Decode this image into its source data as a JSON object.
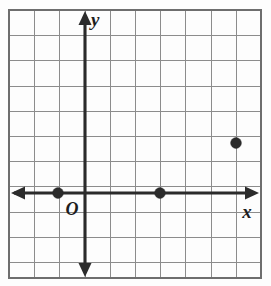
{
  "figure": {
    "kind": "coordinate-plane",
    "axis_labels": {
      "x": "x",
      "y": "y",
      "origin": "O"
    },
    "colors": {
      "background": "#fdfdfd",
      "grid_line": "#8c8c8c",
      "grid_border": "#6e6e6e",
      "axis": "#2b2b2b",
      "point": "#2b2b2b",
      "label": "#1d1d1d"
    }
  },
  "chart_data": {
    "type": "scatter",
    "title": "",
    "xlabel": "x",
    "ylabel": "y",
    "grid": true,
    "legend": false,
    "origin_label": "O",
    "xlim": [
      -3,
      7
    ],
    "ylim": [
      -3,
      7
    ],
    "xticks": [
      -3,
      -2,
      -1,
      0,
      1,
      2,
      3,
      4,
      5,
      6,
      7
    ],
    "yticks": [
      -3,
      -2,
      -1,
      0,
      1,
      2,
      3,
      4,
      5,
      6,
      7
    ],
    "tick_labels_shown": false,
    "grid_step": 1,
    "series": [
      {
        "name": "points",
        "marker": "filled-circle",
        "points": [
          {
            "x": -1,
            "y": 0,
            "px": 58,
            "py": 193
          },
          {
            "x": 3,
            "y": 0,
            "px": 160,
            "py": 193
          },
          {
            "x": 6,
            "y": 2,
            "px": 236,
            "py": 143
          }
        ]
      }
    ]
  },
  "geometry": {
    "grid": {
      "left": 9,
      "top": 10,
      "right": 261,
      "bottom": 278,
      "cell": 25.2
    },
    "axes": {
      "x_axis_y": 193,
      "y_axis_x": 85,
      "x_left_tip": 11,
      "x_right_tip": 259,
      "y_top_tip": 11,
      "y_bottom_tip": 277
    }
  }
}
